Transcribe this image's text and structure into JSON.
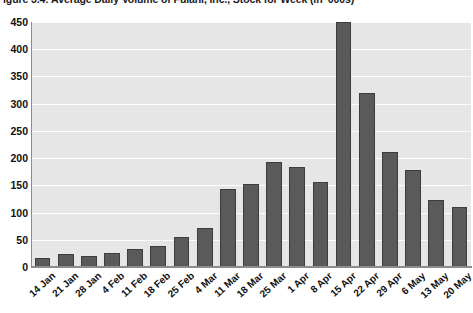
{
  "chart_data": {
    "type": "bar",
    "title": "igure 3.4: Average Daily Volume of Fulani, Inc., Stock for Week (in '000s)",
    "xlabel": "",
    "ylabel": "",
    "ylim": [
      0,
      450
    ],
    "yticks": [
      0,
      50,
      100,
      150,
      200,
      250,
      300,
      350,
      400,
      450
    ],
    "ytick_labels": [
      "0",
      "50",
      "100",
      "150",
      "200",
      "250",
      "300",
      "350",
      "400",
      "450"
    ],
    "grid": true,
    "legend": "none",
    "categories": [
      "14 Jan",
      "21 Jan",
      "28 Jan",
      "4 Feb",
      "11 Feb",
      "18 Feb",
      "25 Feb",
      "4 Mar",
      "11 Mar",
      "18 Mar",
      "25 Mar",
      "1 Apr",
      "8 Apr",
      "15 Apr",
      "22 Apr",
      "29 Apr",
      "6 May",
      "13 May",
      "20 May"
    ],
    "values": [
      17,
      24,
      20,
      25,
      33,
      38,
      55,
      72,
      143,
      152,
      193,
      183,
      157,
      450,
      320,
      211,
      178,
      123,
      110
    ]
  },
  "colors": {
    "bar_fill": "#5a5a5a",
    "bar_edge": "#3d3d3d",
    "plot_background": "#e6e6e6",
    "gridline": "#fdfdfd",
    "axis": "#8c8c8c",
    "text": "#111111",
    "page_background": "#ffffff"
  }
}
